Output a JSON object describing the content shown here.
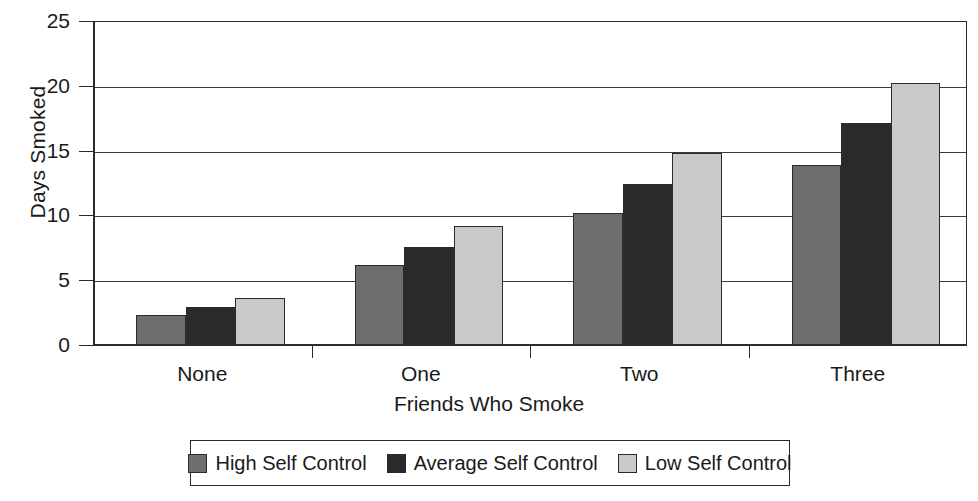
{
  "chart_data": {
    "type": "bar",
    "title": "",
    "xlabel": "Friends Who Smoke",
    "ylabel": "Days Smoked",
    "categories": [
      "None",
      "One",
      "Two",
      "Three"
    ],
    "series": [
      {
        "name": "High Self Control",
        "color": "#6e6e6e",
        "values": [
          2.3,
          6.2,
          10.2,
          13.9
        ]
      },
      {
        "name": "Average Self Control",
        "color": "#2a2a2a",
        "values": [
          2.9,
          7.6,
          12.4,
          17.1
        ]
      },
      {
        "name": "Low Self Control",
        "color": "#c9c9c9",
        "values": [
          3.6,
          9.2,
          14.8,
          20.2
        ]
      }
    ],
    "ylim": [
      0,
      25
    ],
    "ytick_values": [
      0,
      5,
      10,
      15,
      20,
      25
    ],
    "ytick_labels": [
      "0",
      "5",
      "10",
      "15",
      "20",
      "25"
    ],
    "grid": "horizontal",
    "legend_position": "bottom"
  },
  "axes": {
    "y_title": "Days Smoked",
    "x_title": "Friends Who Smoke"
  }
}
